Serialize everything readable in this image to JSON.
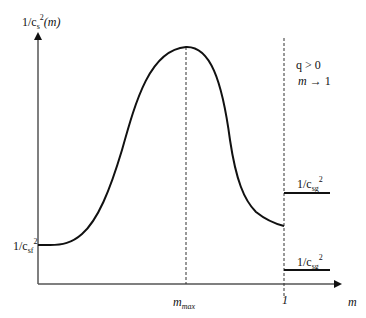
{
  "diagram": {
    "y_axis_label": {
      "prefix": "1/c",
      "sub": "s",
      "sup": "2",
      "suffix": "(m)"
    },
    "x_axis_label": "m",
    "x_ticks": [
      {
        "base": "m",
        "sub": "max"
      },
      {
        "label": "1"
      }
    ],
    "left_level_label": {
      "prefix": "1/c",
      "sub": "sf",
      "sup": "2"
    },
    "right_upper_label": {
      "prefix": "1/c",
      "sub": "sg",
      "sup": "2"
    },
    "right_lower_label": {
      "prefix": "1/c",
      "sub": "sg",
      "sup": "2"
    },
    "condition_line1": "q > 0",
    "condition_line2": {
      "var": "m",
      "rest": " → 1"
    },
    "colors": {
      "curve": "#111111",
      "axis": "#555555",
      "dashed": "#333333"
    }
  }
}
